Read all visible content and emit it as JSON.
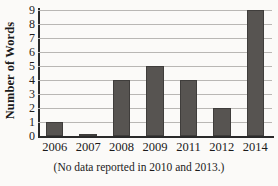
{
  "chart_data": {
    "type": "bar",
    "title": "",
    "xlabel": "",
    "ylabel": "Number of Words",
    "categories": [
      "2006",
      "2007",
      "2008",
      "2009",
      "2011",
      "2012",
      "2014"
    ],
    "values": [
      1,
      0,
      4,
      5,
      4,
      2,
      9
    ],
    "ylim": [
      0,
      9
    ],
    "ytick_labels": [
      "0",
      "1",
      "2",
      "3",
      "4",
      "5",
      "6",
      "7",
      "8",
      "9"
    ],
    "grid": true,
    "legend": "none",
    "bar_color": "#575451",
    "gridline_color": "#b9b7b4",
    "axis_color": "#2a2a2a",
    "caption": "(No data reported in 2010 and 2013.)"
  }
}
